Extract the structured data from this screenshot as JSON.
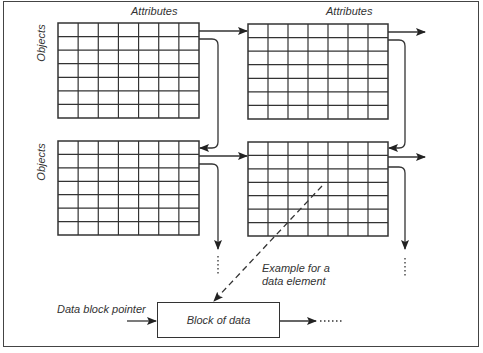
{
  "diagram": {
    "column_headers": [
      "Attributes",
      "Attributes"
    ],
    "row_headers": [
      "Objects",
      "Objects"
    ],
    "grids": [
      {
        "id": "top-left",
        "rows": 7,
        "columns": 7
      },
      {
        "id": "top-right",
        "rows": 7,
        "columns": 7
      },
      {
        "id": "bottom-left",
        "rows": 7,
        "columns": 7
      },
      {
        "id": "bottom-right",
        "rows": 7,
        "columns": 7
      }
    ],
    "example_label_line1": "Example for a",
    "example_label_line2": "data element",
    "pointer_label": "Data block pointer",
    "block_label": "Block of data",
    "continuation": "....",
    "colors": {
      "line": "#333333",
      "background": "#ffffff"
    }
  }
}
